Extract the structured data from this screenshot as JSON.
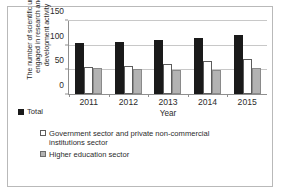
{
  "chart_data": {
    "type": "bar",
    "title": "",
    "xlabel": "Year",
    "ylabel": "The number of scientific units engaged in research and development activity",
    "categories": [
      "2011",
      "2012",
      "2013",
      "2014",
      "2015"
    ],
    "series": [
      {
        "name": "Total",
        "values": [
          105,
          106,
          111,
          116,
          122
        ],
        "color": "#1a1a1a"
      },
      {
        "name": "Government sector and private non-commercial institutions sector",
        "values": [
          55,
          57,
          62,
          67,
          72
        ],
        "color": "#ffffff"
      },
      {
        "name": "Higher education sector",
        "values": [
          53,
          51,
          50,
          49,
          53
        ],
        "color": "#b3b3b3"
      }
    ],
    "ylim": [
      0,
      150
    ],
    "y_ticks": [
      0,
      50,
      100,
      150
    ],
    "grid": true,
    "legend_position": "bottom"
  },
  "axes": {
    "y_title_line1": "The number of scientific units",
    "y_title_line2": "engaged in research and",
    "y_title_line3": "development activity",
    "x_title": "Year"
  },
  "legend": {
    "total": "Total",
    "government_line1": "Government sector and private non-commercial",
    "government_line2": "institutions sector",
    "higher_education": "Higher education sector"
  }
}
